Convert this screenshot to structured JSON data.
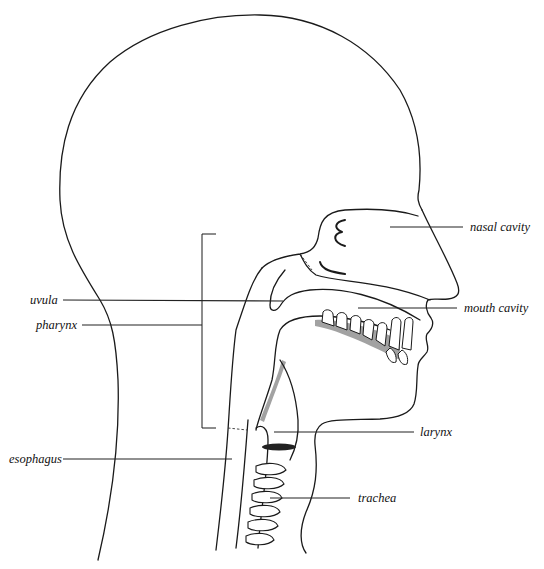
{
  "diagram": {
    "type": "anatomical-illustration",
    "labels": {
      "nasal_cavity": "nasal cavity",
      "mouth_cavity": "mouth cavity",
      "uvula": "uvula",
      "pharynx": "pharynx",
      "larynx": "larynx",
      "esophagus": "esophagus",
      "trachea": "trachea"
    },
    "colors": {
      "line": "#1a1a1a",
      "background": "#ffffff"
    }
  }
}
